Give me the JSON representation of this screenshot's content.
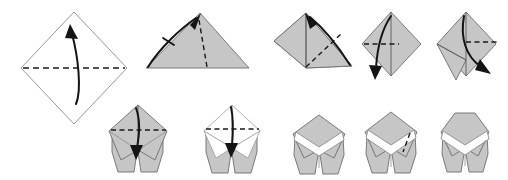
{
  "figure": {
    "kind": "instructional-diagram",
    "total_steps": 10,
    "rows": 2,
    "colors": {
      "paper_front_fill": "#c6c6c6",
      "paper_back_fill": "#ffffff",
      "outline": "#6e6e6e",
      "crease_line": "#5a5a5a",
      "fold_dash": "#1a1a1a",
      "arrow": "#141414",
      "background": "#ffffff"
    }
  },
  "row1": {
    "label": "Top row",
    "steps": [
      {
        "index": 1,
        "name": "square-diamond-with-horizontal-valley-fold",
        "shape": "diamond",
        "fill": "white",
        "fold_line": "horizontal-dashed",
        "arrow": "curved-up",
        "description": "White square rotated 45 degrees with horizontal dashed fold line across the middle and a curved arrow pointing upward"
      },
      {
        "index": 2,
        "name": "folded-triangle-with-diagonal-fold",
        "shape": "wide-triangle",
        "fill": "gray",
        "fold_line": "diagonal-dashed",
        "arrow": "curved-up-right-with-tick",
        "description": "Gray wide triangle with a diagonal dashed fold line and a curved arrow sweeping from lower left to the apex"
      },
      {
        "index": 3,
        "name": "partially-opened-with-diagonal-fold",
        "shape": "asymmetric-kite",
        "fill": "gray",
        "fold_line": "diagonal-dashed",
        "arrow": "curved-up-left",
        "description": "Gray asymmetric shape with center crease, diagonal dashed fold and a curved arrow from lower right to the top apex"
      },
      {
        "index": 4,
        "name": "upright-diamond-with-horizontal-fold",
        "shape": "diamond",
        "fill": "gray",
        "fold_line": "horizontal-dashed-left",
        "arrow": "curved-down-left",
        "description": "Gray upright diamond with vertical center crease, short horizontal dashed fold on the left and a curved arrow pointing down"
      },
      {
        "index": 5,
        "name": "diamond-with-leg-and-right-fold",
        "shape": "diamond-with-flap",
        "fill": "gray",
        "fold_line": "horizontal-dashed-right",
        "arrow": "curved-down-right",
        "description": "Gray diamond with a pulled-out flap at lower left, horizontal dashed fold on the right and a curved arrow pointing down-right"
      }
    ]
  },
  "row2": {
    "label": "Bottom row",
    "steps": [
      {
        "index": 6,
        "name": "two-legged-form-with-horizontal-fold",
        "shape": "two-legged",
        "fill": "gray",
        "fold_line": "horizontal-dashed",
        "arrow": "straight-down",
        "description": "Gray two-legged form with horizontal dashed fold line across the body and a straight arrow pointing down"
      },
      {
        "index": 7,
        "name": "white-top-with-horizontal-fold",
        "shape": "two-legged",
        "fill": "white-top-gray-legs",
        "fold_line": "horizontal-dashed",
        "arrow": "straight-down",
        "description": "Form with white upper diamond, horizontal dashed fold and a downward arrow, gray legs below"
      },
      {
        "index": 8,
        "name": "chevron-notch-form",
        "shape": "two-legged",
        "fill": "gray-with-white-chevron",
        "fold_line": "none",
        "arrow": "none",
        "description": "Gray two-legged form with a white chevron notch across the upper body"
      },
      {
        "index": 9,
        "name": "chevron-notch-form-with-side-crease",
        "shape": "two-legged",
        "fill": "gray-with-white-chevron",
        "fold_line": "short-dashed-right",
        "arrow": "none",
        "description": "Gray two-legged form with white chevron and a short dashed crease on the right side"
      },
      {
        "index": 10,
        "name": "completed-form",
        "shape": "two-legged",
        "fill": "gray-with-white-chevron",
        "fold_line": "none",
        "arrow": "none",
        "description": "Finished gray two-legged model with a clean white chevron band"
      }
    ]
  }
}
